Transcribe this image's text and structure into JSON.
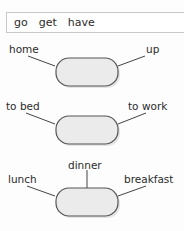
{
  "wordbank": {
    "name": "verb-word-bank",
    "words": [
      "go",
      "get",
      "have"
    ]
  },
  "colors": {
    "background": "#fdfdfd",
    "node_fill": "#ebebeb",
    "node_border": "#555555",
    "line": "#444444",
    "text": "#2b2b2b",
    "wordbank_border": "#c8c8c8",
    "wordbank_fill": "#ffffff",
    "shadow": "#cccccc"
  },
  "groups": [
    {
      "id": "group-1",
      "node_label": "",
      "labels": [
        {
          "position": "left",
          "text": "home"
        },
        {
          "position": "right",
          "text": "up"
        }
      ]
    },
    {
      "id": "group-2",
      "node_label": "",
      "labels": [
        {
          "position": "left",
          "text": "to bed"
        },
        {
          "position": "right",
          "text": "to work"
        }
      ]
    },
    {
      "id": "group-3",
      "node_label": "",
      "labels": [
        {
          "position": "top",
          "text": "dinner"
        },
        {
          "position": "left",
          "text": "lunch"
        },
        {
          "position": "right",
          "text": "breakfast"
        }
      ]
    }
  ]
}
